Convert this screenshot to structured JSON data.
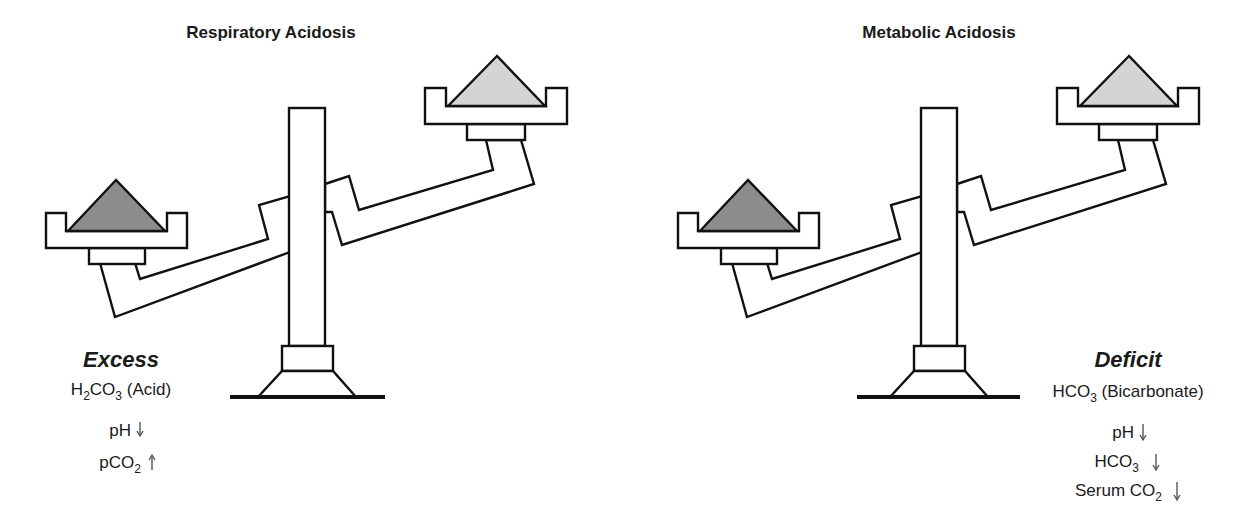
{
  "panels": [
    {
      "title": "Respiratory Acidosis",
      "heavy_side": "left",
      "colors": {
        "left_weight": "#8c8c8c",
        "right_weight": "#d4d4d4"
      },
      "annotation": {
        "heading": "Excess",
        "substance_main": "H",
        "substance_sub1": "2",
        "substance_mid": "CO",
        "substance_sub2": "3",
        "substance_suffix": " (Acid)",
        "indicators": [
          {
            "label": "pH",
            "sub": "",
            "direction": "down",
            "arrow": "↓"
          },
          {
            "label": "pCO",
            "sub": "2",
            "direction": "up",
            "arrow": "↑"
          }
        ]
      }
    },
    {
      "title": "Metabolic Acidosis",
      "heavy_side": "left",
      "colors": {
        "left_weight": "#8c8c8c",
        "right_weight": "#d4d4d4"
      },
      "annotation": {
        "heading": "Deficit",
        "substance_main": "HCO",
        "substance_sub1": "3",
        "substance_suffix": " (Bicarbonate)",
        "indicators": [
          {
            "label": "pH",
            "sub": "",
            "direction": "down",
            "arrow": "↓"
          },
          {
            "label": "HCO",
            "sub": "3",
            "direction": "down",
            "arrow": "↓"
          },
          {
            "label": "Serum CO",
            "sub": "2",
            "direction": "down",
            "arrow": "↓"
          }
        ]
      }
    }
  ]
}
